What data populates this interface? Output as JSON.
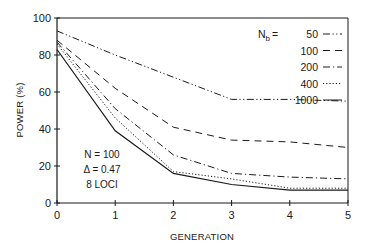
{
  "chart_data": {
    "type": "line",
    "title": "",
    "xlabel": "GENERATION",
    "ylabel": "POWER (%)",
    "x": [
      0,
      1,
      2,
      3,
      4,
      5
    ],
    "xlim": [
      0,
      5
    ],
    "ylim": [
      0,
      100
    ],
    "xticks": [
      "0",
      "1",
      "2",
      "3",
      "4",
      "5"
    ],
    "yticks": [
      "0",
      "20",
      "40",
      "60",
      "80",
      "100"
    ],
    "grid": false,
    "legend_position": "upper right",
    "legend_title": "N_b =",
    "series": [
      {
        "name": "50",
        "style": "dash-dot-dot",
        "values": [
          93,
          80,
          68,
          56,
          56,
          55
        ]
      },
      {
        "name": "100",
        "style": "dashed",
        "values": [
          88,
          62,
          41,
          34,
          33,
          30
        ]
      },
      {
        "name": "200",
        "style": "dash-dot",
        "values": [
          87,
          51,
          26,
          16,
          14,
          13
        ]
      },
      {
        "name": "400",
        "style": "dotted",
        "values": [
          86,
          46,
          17,
          13,
          8,
          8
        ]
      },
      {
        "name": "1000",
        "style": "solid",
        "values": [
          83,
          39,
          16,
          10,
          7,
          7
        ]
      }
    ],
    "annotations": [
      "N = 100",
      "Δ = 0.47",
      "8 LOCI"
    ]
  },
  "labels": {
    "xlabel": "GENERATION",
    "ylabel": "POWER (%)",
    "legend_prefix": "N",
    "legend_sub": "b",
    "legend_eq": "=",
    "annot_n": "N = 100",
    "annot_delta": "Δ = 0.47",
    "annot_loci": "8 LOCI"
  }
}
